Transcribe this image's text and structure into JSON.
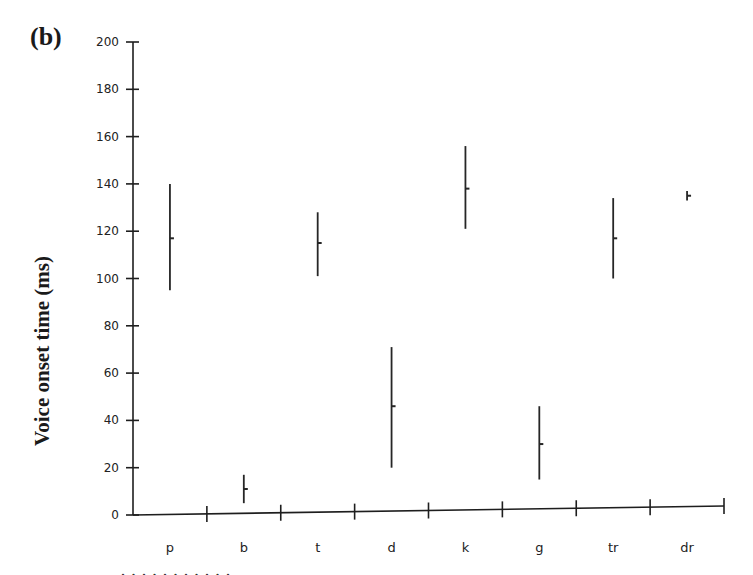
{
  "panel_label": "(b)",
  "chart_data": {
    "type": "errorbar",
    "title": "",
    "xlabel": "",
    "ylabel": "Voice onset time (ms)",
    "ylim": [
      0,
      200
    ],
    "yticks": [
      0,
      20,
      40,
      60,
      80,
      100,
      120,
      140,
      160,
      180,
      200
    ],
    "grid": false,
    "legend": null,
    "categories": [
      "p",
      "b",
      "t",
      "d",
      "k",
      "g",
      "tr",
      "dr"
    ],
    "series": [
      {
        "name": "VOT",
        "mean": [
          117,
          11,
          115,
          46,
          138,
          30,
          117,
          135
        ],
        "low": [
          95,
          5,
          101,
          20,
          121,
          15,
          100,
          133
        ],
        "high": [
          140,
          17,
          128,
          71,
          156,
          46,
          134,
          137
        ]
      }
    ]
  },
  "footer_fragment": "· · · · · · · · · · ·"
}
